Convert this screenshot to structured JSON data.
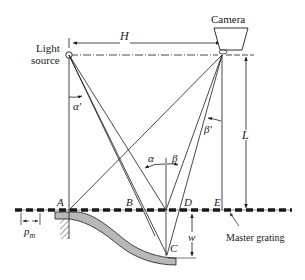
{
  "diagram": {
    "type": "shadow-moire setup",
    "labels": {
      "camera": "Camera",
      "light_source_line1": "Light",
      "light_source_line2": "source",
      "H": "H",
      "L": "L",
      "alpha_prime": "α'",
      "beta_prime": "β'",
      "alpha": "α",
      "beta": "β",
      "A": "A",
      "B": "B",
      "C": "C",
      "D": "D",
      "E": "E",
      "w": "w",
      "p_m": "p",
      "p_m_sub": "m",
      "master_grating": "Master grating"
    },
    "colors": {
      "ink": "#1a1a1a",
      "specimen_fill": "#b8b8b8"
    }
  }
}
